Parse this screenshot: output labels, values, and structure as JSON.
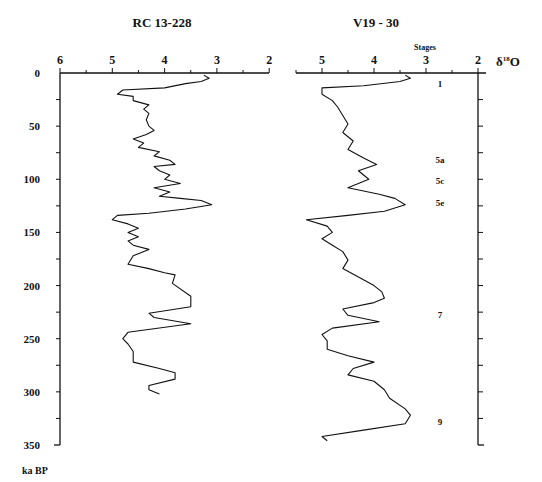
{
  "chart_data": [
    {
      "type": "line",
      "title": "RC13-228",
      "orientation": "vertical (depth/age on y, inverted)",
      "xlabel": "δ18O",
      "ylabel": "ka BP",
      "xlim": [
        6,
        2
      ],
      "ylim": [
        0,
        350
      ],
      "xticks": [
        6,
        5,
        4,
        3,
        2
      ],
      "yticks": [
        0,
        50,
        100,
        150,
        200,
        250,
        300,
        350
      ],
      "points": [
        [
          3.25,
          2
        ],
        [
          3.15,
          5
        ],
        [
          3.3,
          8
        ],
        [
          3.6,
          10
        ],
        [
          4.0,
          14
        ],
        [
          4.8,
          16
        ],
        [
          4.9,
          20
        ],
        [
          4.6,
          22
        ],
        [
          4.6,
          26
        ],
        [
          4.3,
          30
        ],
        [
          4.4,
          34
        ],
        [
          4.3,
          38
        ],
        [
          4.35,
          44
        ],
        [
          4.3,
          50
        ],
        [
          4.2,
          54
        ],
        [
          4.35,
          58
        ],
        [
          4.6,
          62
        ],
        [
          4.4,
          66
        ],
        [
          4.5,
          70
        ],
        [
          4.1,
          74
        ],
        [
          4.2,
          78
        ],
        [
          3.9,
          82
        ],
        [
          3.8,
          86
        ],
        [
          4.2,
          88
        ],
        [
          4.1,
          92
        ],
        [
          3.9,
          96
        ],
        [
          4.0,
          100
        ],
        [
          3.7,
          104
        ],
        [
          4.2,
          108
        ],
        [
          3.9,
          112
        ],
        [
          4.1,
          116
        ],
        [
          3.7,
          118
        ],
        [
          3.3,
          120
        ],
        [
          3.1,
          124
        ],
        [
          3.6,
          128
        ],
        [
          4.3,
          132
        ],
        [
          4.9,
          134
        ],
        [
          5.0,
          138
        ],
        [
          4.7,
          142
        ],
        [
          4.5,
          146
        ],
        [
          4.7,
          150
        ],
        [
          4.5,
          154
        ],
        [
          4.7,
          158
        ],
        [
          4.6,
          162
        ],
        [
          4.3,
          166
        ],
        [
          4.6,
          172
        ],
        [
          4.7,
          180
        ],
        [
          4.3,
          184
        ],
        [
          4.0,
          188
        ],
        [
          3.8,
          190
        ],
        [
          3.85,
          198
        ],
        [
          3.5,
          210
        ],
        [
          3.5,
          220
        ],
        [
          4.3,
          226
        ],
        [
          4.2,
          230
        ],
        [
          3.5,
          236
        ],
        [
          4.7,
          244
        ],
        [
          4.8,
          250
        ],
        [
          4.7,
          255
        ],
        [
          4.6,
          262
        ],
        [
          4.6,
          272
        ],
        [
          4.1,
          278
        ],
        [
          3.8,
          282
        ],
        [
          3.8,
          288
        ],
        [
          4.3,
          294
        ],
        [
          4.3,
          298
        ],
        [
          4.1,
          302
        ]
      ]
    },
    {
      "type": "line",
      "title": "V19-30",
      "orientation": "vertical (depth/age on y, inverted)",
      "xlabel": "δ18O",
      "ylabel": "ka BP",
      "xlim": [
        6,
        2
      ],
      "ylim": [
        0,
        350
      ],
      "xticks": [
        5,
        4,
        3,
        2
      ],
      "yticks": [
        0,
        50,
        100,
        150,
        200,
        250,
        300,
        350
      ],
      "points": [
        [
          3.4,
          2
        ],
        [
          3.3,
          5
        ],
        [
          3.5,
          8
        ],
        [
          4.2,
          12
        ],
        [
          5.0,
          14
        ],
        [
          5.0,
          20
        ],
        [
          4.8,
          26
        ],
        [
          4.7,
          32
        ],
        [
          4.6,
          40
        ],
        [
          4.5,
          48
        ],
        [
          4.6,
          56
        ],
        [
          4.4,
          64
        ],
        [
          4.5,
          72
        ],
        [
          4.2,
          80
        ],
        [
          3.95,
          86
        ],
        [
          4.3,
          92
        ],
        [
          4.1,
          100
        ],
        [
          4.5,
          108
        ],
        [
          3.9,
          114
        ],
        [
          3.6,
          118
        ],
        [
          3.4,
          124
        ],
        [
          3.8,
          130
        ],
        [
          4.5,
          134
        ],
        [
          5.3,
          138
        ],
        [
          4.9,
          144
        ],
        [
          4.8,
          150
        ],
        [
          5.0,
          156
        ],
        [
          4.8,
          162
        ],
        [
          4.6,
          168
        ],
        [
          4.5,
          176
        ],
        [
          4.6,
          184
        ],
        [
          4.3,
          192
        ],
        [
          4.0,
          200
        ],
        [
          3.85,
          206
        ],
        [
          3.8,
          212
        ],
        [
          4.0,
          216
        ],
        [
          4.6,
          222
        ],
        [
          4.5,
          228
        ],
        [
          3.9,
          234
        ],
        [
          4.8,
          240
        ],
        [
          5.0,
          246
        ],
        [
          4.9,
          252
        ],
        [
          4.9,
          260
        ],
        [
          4.5,
          266
        ],
        [
          4.0,
          272
        ],
        [
          4.4,
          278
        ],
        [
          4.5,
          284
        ],
        [
          4.0,
          290
        ],
        [
          3.8,
          298
        ],
        [
          3.7,
          306
        ],
        [
          3.4,
          316
        ],
        [
          3.3,
          322
        ],
        [
          3.4,
          330
        ],
        [
          4.2,
          336
        ],
        [
          5.0,
          342
        ],
        [
          4.9,
          346
        ]
      ]
    }
  ],
  "panels": {
    "left": {
      "title": "RC 13-228"
    },
    "right": {
      "title": "V19 - 30",
      "stages_label": "Stages"
    }
  },
  "axis": {
    "x_ticks_left": [
      "6",
      "5",
      "4",
      "3",
      "2"
    ],
    "x_ticks_right": [
      "5",
      "4",
      "3",
      "2"
    ],
    "x_label": "δ",
    "x_label_sup": "18",
    "x_label_tail": "O",
    "y_ticks": [
      "0",
      "50",
      "100",
      "150",
      "200",
      "250",
      "300",
      "350"
    ],
    "y_label": "ka  BP"
  },
  "stages": [
    {
      "label": "1",
      "age": 10
    },
    {
      "label": "5a",
      "age": 82
    },
    {
      "label": "5c",
      "age": 102
    },
    {
      "label": "5e",
      "age": 122
    },
    {
      "label": "7",
      "age": 228
    },
    {
      "label": "9",
      "age": 328
    }
  ],
  "colors": {
    "line": "#111111",
    "background": "#ffffff"
  }
}
